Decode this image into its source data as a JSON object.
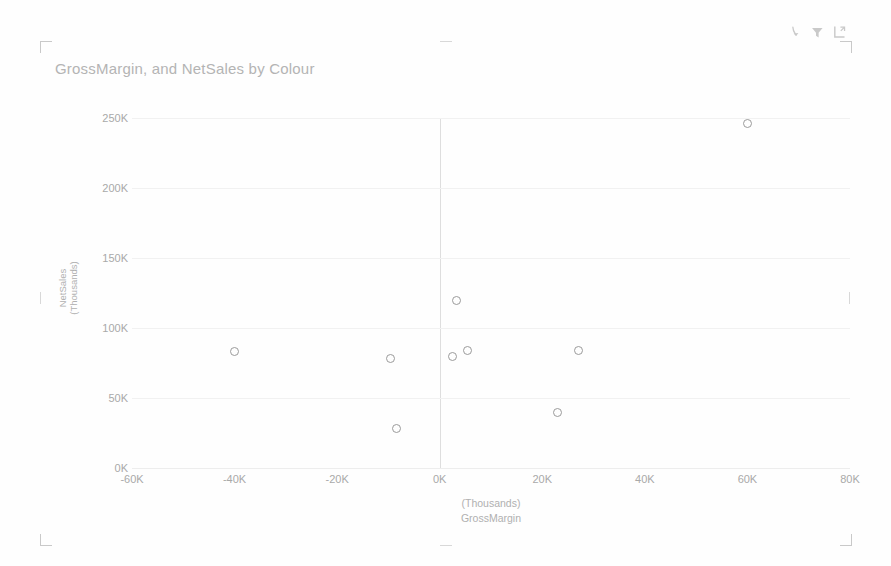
{
  "visual": {
    "title": "GrossMargin, and NetSales by Colour"
  },
  "header": {
    "icons": [
      {
        "name": "drill-down-icon",
        "label": "Drill down"
      },
      {
        "name": "filter-icon",
        "label": "Filters"
      },
      {
        "name": "focus-mode-icon",
        "label": "Focus mode"
      }
    ]
  },
  "chart_data": {
    "type": "scatter",
    "title": "GrossMargin, and NetSales by Colour",
    "xlabel": "GrossMargin",
    "xunit": "(Thousands)",
    "ylabel": "NetSales",
    "yunit": "(Thousands)",
    "xlim": [
      -60000,
      80000
    ],
    "ylim": [
      0,
      250000
    ],
    "xticks": [
      -60000,
      -40000,
      -20000,
      0,
      20000,
      40000,
      60000,
      80000
    ],
    "xticklabels": [
      "-60K",
      "-40K",
      "-20K",
      "0K",
      "20K",
      "40K",
      "60K",
      "80K"
    ],
    "yticks": [
      0,
      50000,
      100000,
      150000,
      200000,
      250000
    ],
    "yticklabels": [
      "0K",
      "50K",
      "100K",
      "150K",
      "200K",
      "250K"
    ],
    "grid": true,
    "legend": "none",
    "marker": {
      "shape": "circle",
      "filled": false,
      "stroke": "#9b9b9b",
      "size": 9
    },
    "points": [
      {
        "x": -40000,
        "y": 83000
      },
      {
        "x": -9500,
        "y": 78000
      },
      {
        "x": -8500,
        "y": 28000
      },
      {
        "x": 2500,
        "y": 80000
      },
      {
        "x": 3200,
        "y": 120000
      },
      {
        "x": 5500,
        "y": 84000
      },
      {
        "x": 23000,
        "y": 40000
      },
      {
        "x": 27000,
        "y": 84000
      },
      {
        "x": 60000,
        "y": 246000
      }
    ]
  },
  "colors": {
    "background": "#ffffff",
    "grid": "#f1f1f1",
    "axis_text": "#a9a9a9",
    "title_text": "#b4b4b4",
    "marker_stroke": "#9b9b9b",
    "zero_line": "#dedede"
  }
}
